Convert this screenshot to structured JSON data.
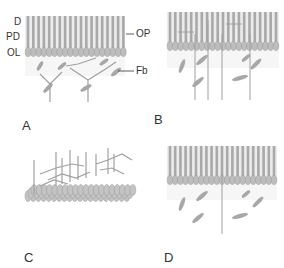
{
  "figure": {
    "panels": [
      {
        "id": "A",
        "label": "A",
        "description": "Organized cochlear epithelium with outer pillar cells and fibroblasts"
      },
      {
        "id": "B",
        "label": "B",
        "description": "Epithelium with vertical processes and scattered fibroblasts"
      },
      {
        "id": "C",
        "label": "C",
        "description": "Perspective view of cell layer with branching processes"
      },
      {
        "id": "D",
        "label": "D",
        "description": "Epithelium with single vertical process and fibroblasts"
      }
    ],
    "layer_labels": {
      "d": "D",
      "pd": "PD",
      "ol": "OL"
    },
    "callouts": {
      "op": "OP",
      "fb": "Fb"
    },
    "colors": {
      "cell": "#b8b8b8",
      "cell_dark": "#8c8c8c",
      "background_band": "#e6e6e6",
      "fibroblast": "#a8a8a8",
      "label": "#333333"
    }
  }
}
